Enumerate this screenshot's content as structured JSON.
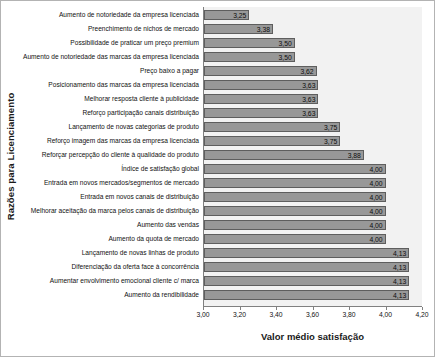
{
  "chart_data": {
    "type": "bar",
    "orientation": "horizontal",
    "title": "",
    "xlabel": "Valor médio satisfação",
    "ylabel": "Razões para Licenciamento",
    "xlim": [
      3.0,
      4.2
    ],
    "grid": false,
    "legend": null,
    "xticks": [
      "3,00",
      "3,20",
      "3,40",
      "3,60",
      "3,80",
      "4,00",
      "4,20"
    ],
    "xtick_values": [
      3.0,
      3.2,
      3.4,
      3.6,
      3.8,
      4.0,
      4.2
    ],
    "bar_color": "#989898",
    "bar_edge_color": "#5e5e5e",
    "plot_background": "#f2f2f2",
    "categories": [
      "Aumento de notoriedade da empresa licenciada",
      "Preenchimento de nichos de mercado",
      "Possibilidade de praticar um preço premium",
      "Aumento de notoriedade das marcas da empresa licenciada",
      "Preço baixo a pagar",
      "Posicionamento das marcas da empresa licenciada",
      "Melhorar resposta cliente à publicidade",
      "Reforço participação canais distribuição",
      "Lançamento de novas categorias de produto",
      "Reforço imagem das marcas da empresa licenciada",
      "Reforçar percepção do cliente à qualidade do produto",
      "Índice de satisfação global",
      "Entrada em novos mercados/segmentos de mercado",
      "Entrada em novos canais de distribuição",
      "Melhorar aceitação da marca pelos canais de distribuição",
      "Aumento das vendas",
      "Aumento da quota de mercado",
      "Lançamento de novas linhas de produto",
      "Diferenciação da oferta face à concorrência",
      "Aumentar envolvimento emocional cliente c/ marca",
      "Aumento da rendibilidade"
    ],
    "values": [
      3.25,
      3.38,
      3.5,
      3.5,
      3.62,
      3.63,
      3.63,
      3.63,
      3.75,
      3.75,
      3.88,
      4.0,
      4.0,
      4.0,
      4.0,
      4.0,
      4.0,
      4.13,
      4.13,
      4.13,
      4.13
    ],
    "value_labels": [
      "3,25",
      "3,38",
      "3,50",
      "3,50",
      "3,62",
      "3,63",
      "3,63",
      "3,63",
      "3,75",
      "3,75",
      "3,88",
      "4,00",
      "4,00",
      "4,00",
      "4,00",
      "4,00",
      "4,00",
      "4,13",
      "4,13",
      "4,13",
      "4,13"
    ]
  }
}
